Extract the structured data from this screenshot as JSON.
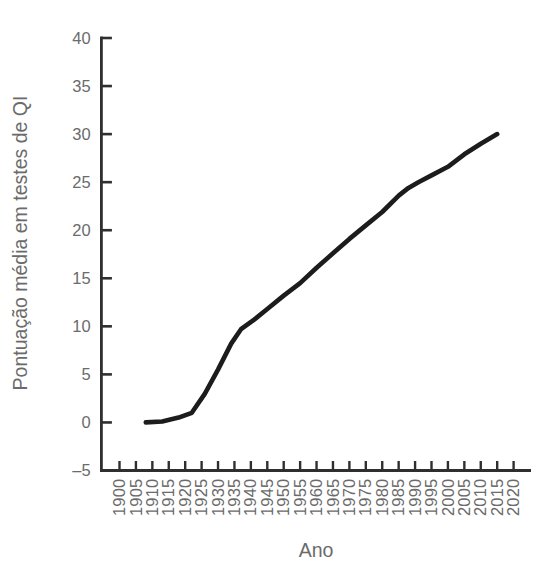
{
  "figure": {
    "background": "#ffffff",
    "axis_color": "#2f2f2f",
    "label_color": "#6b6b6b"
  },
  "chart_data": {
    "type": "line",
    "title": "",
    "xlabel": "Ano",
    "ylabel": "Pontuação média em testes de QI",
    "xlim": [
      1900,
      2020
    ],
    "ylim": [
      -5,
      40
    ],
    "grid": false,
    "legend": "none",
    "x_tick_labels": [
      "1900",
      "1905",
      "1910",
      "1915",
      "1920",
      "1925",
      "1930",
      "1935",
      "1940",
      "1945",
      "1950",
      "1955",
      "1960",
      "1965",
      "1970",
      "1975",
      "1980",
      "1985",
      "1990",
      "1995",
      "2000",
      "2005",
      "2010",
      "2015",
      "2020"
    ],
    "x_ticks": [
      1900,
      1905,
      1910,
      1915,
      1920,
      1925,
      1930,
      1935,
      1940,
      1945,
      1950,
      1955,
      1960,
      1965,
      1970,
      1975,
      1980,
      1985,
      1990,
      1995,
      2000,
      2005,
      2010,
      2015,
      2020
    ],
    "y_ticks": [
      -5,
      0,
      5,
      10,
      15,
      20,
      25,
      30,
      35,
      40
    ],
    "series": [
      {
        "color": "#1c1c1c",
        "stroke_width": 4.6,
        "points": [
          [
            1908,
            0
          ],
          [
            1913,
            0.1
          ],
          [
            1918,
            0.5
          ],
          [
            1922,
            1.0
          ],
          [
            1926,
            3.0
          ],
          [
            1930,
            5.5
          ],
          [
            1934,
            8.2
          ],
          [
            1937,
            9.7
          ],
          [
            1941,
            10.7
          ],
          [
            1945,
            11.8
          ],
          [
            1950,
            13.2
          ],
          [
            1955,
            14.5
          ],
          [
            1960,
            16.1
          ],
          [
            1965,
            17.6
          ],
          [
            1970,
            19.1
          ],
          [
            1975,
            20.5
          ],
          [
            1980,
            21.9
          ],
          [
            1985,
            23.6
          ],
          [
            1988,
            24.4
          ],
          [
            1991,
            25.0
          ],
          [
            1995,
            25.7
          ],
          [
            2000,
            26.6
          ],
          [
            2005,
            27.9
          ],
          [
            2010,
            29.0
          ],
          [
            2015,
            30.0
          ]
        ]
      }
    ]
  }
}
